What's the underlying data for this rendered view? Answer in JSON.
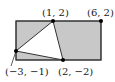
{
  "diagram": {
    "type": "geometry-figure",
    "colors": {
      "shade": "#c8c8c8",
      "stroke": "#333333",
      "background": "#ffffff"
    },
    "points": [
      {
        "id": "p1",
        "label": "(1, 2)",
        "x": 1,
        "y": 2
      },
      {
        "id": "p2",
        "label": "(6, 2)",
        "x": 6,
        "y": 2
      },
      {
        "id": "p3",
        "label": "(−3, −1)",
        "x": -3,
        "y": -1
      },
      {
        "id": "p4",
        "label": "(2, −2)",
        "x": 2,
        "y": -2
      }
    ],
    "rectangle": {
      "corners": [
        "(-3, 2)",
        "(6, 2)",
        "(6, -2)",
        "(-3, -2)"
      ],
      "shaded": true
    },
    "triangle": {
      "vertices": [
        "(-3, -1)",
        "(1, 2)",
        "(2, -2)"
      ],
      "shaded": false
    }
  }
}
